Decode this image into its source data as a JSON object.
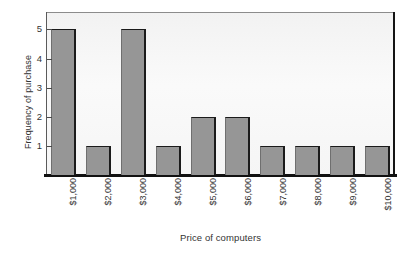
{
  "chart_data": {
    "type": "bar",
    "title": "",
    "xlabel": "Price of computers",
    "ylabel": "Frequency of purchase",
    "categories": [
      "$1,000",
      "$2,000",
      "$3,000",
      "$4,000",
      "$5,000",
      "$6,000",
      "$7,000",
      "$8,000",
      "$9,000",
      "$10,000"
    ],
    "values": [
      5,
      1,
      5,
      1,
      2,
      2,
      1,
      1,
      1,
      1
    ],
    "ylim": [
      0,
      5.6
    ],
    "yticks": [
      1,
      2,
      3,
      4,
      5
    ],
    "ytick_labels": [
      "1",
      "2",
      "3",
      "4",
      "5"
    ],
    "grid": false,
    "legend": null,
    "bar_color": "#969696",
    "bar_edge_color": "#1b1b1b",
    "plot_background": "#f5f5f5",
    "axis_color": "#111111",
    "text_color": "#333333",
    "xtick_rotation": 90
  }
}
